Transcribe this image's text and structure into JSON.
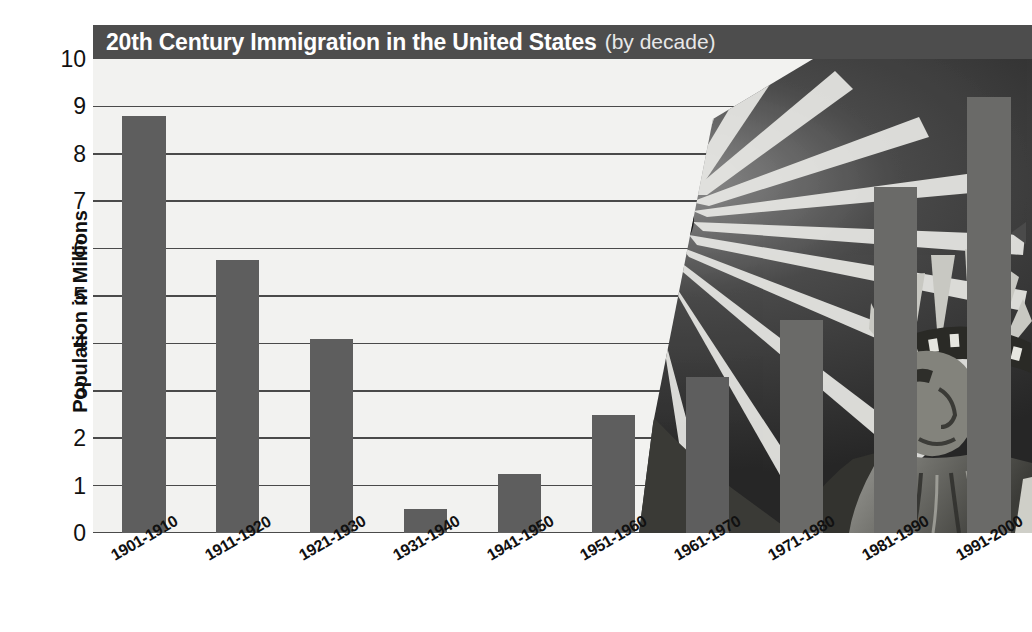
{
  "chart_data": {
    "type": "bar",
    "title": "20th Century Immigration in the United States",
    "subtitle": "(by decade)",
    "xlabel": "",
    "ylabel": "Population in Millions",
    "ylim": [
      0,
      10
    ],
    "ytick_labels": [
      "10",
      "9",
      "8",
      "7",
      "6",
      "5",
      "4",
      "3",
      "2",
      "1",
      "0"
    ],
    "ytick_values": [
      10,
      9,
      8,
      7,
      6,
      5,
      4,
      3,
      2,
      1,
      0
    ],
    "grid": true,
    "legend": null,
    "categories": [
      "1901-1910",
      "1911-1920",
      "1921-1930",
      "1931-1940",
      "1941-1950",
      "1951-1960",
      "1961-1970",
      "1971-1980",
      "1981-1990",
      "1991-2000"
    ],
    "values": [
      8.8,
      5.75,
      4.1,
      0.5,
      1.25,
      2.5,
      3.3,
      4.5,
      7.3,
      9.2
    ],
    "units": "millions"
  },
  "colors": {
    "title_bar": "#4d4d4d",
    "title_text": "#ffffff",
    "plot_background": "#f2f2f0",
    "bar": "#5e5e5e",
    "gridline": "#4a4a4a",
    "photo_dark": "#2e2e2e",
    "axis_text": "#111111"
  },
  "decoration": {
    "photo_subject": "statue-of-liberty",
    "edge_marker": "left-pointing-triangle"
  }
}
